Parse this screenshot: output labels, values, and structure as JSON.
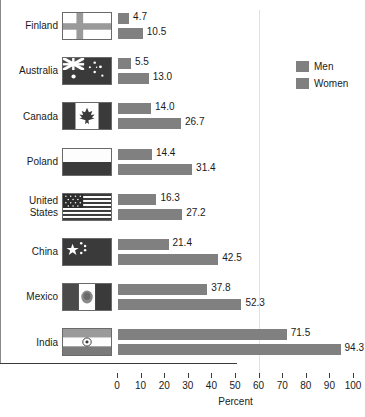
{
  "chart_data": {
    "type": "bar",
    "orientation": "horizontal",
    "title": "",
    "xlabel": "Percent",
    "ylabel": "",
    "xlim": [
      0,
      100
    ],
    "xticks": [
      0,
      10,
      20,
      30,
      40,
      50,
      60,
      70,
      80,
      90,
      100
    ],
    "grid": false,
    "legend_position": "top-right",
    "categories": [
      "Finland",
      "Australia",
      "Canada",
      "Poland",
      "United States",
      "China",
      "Mexico",
      "India"
    ],
    "series": [
      {
        "name": "Men",
        "color": "#808080",
        "values": [
          4.7,
          5.5,
          14.0,
          14.4,
          16.3,
          21.4,
          37.8,
          71.5
        ]
      },
      {
        "name": "Women",
        "color": "#808080",
        "values": [
          10.5,
          13.0,
          26.7,
          31.4,
          27.2,
          42.5,
          52.3,
          94.3
        ]
      }
    ]
  },
  "axis": {
    "tick_labels": [
      "0",
      "10",
      "20",
      "30",
      "40",
      "50",
      "60",
      "70",
      "80",
      "90",
      "100"
    ],
    "title": "Percent"
  },
  "legend": {
    "items": [
      {
        "label": "Men",
        "color": "#808080"
      },
      {
        "label": "Women",
        "color": "#808080"
      }
    ]
  },
  "rows": [
    {
      "country": "Finland",
      "flag": "flag-finland",
      "men_value": "4.7",
      "women_value": "10.5"
    },
    {
      "country": "Australia",
      "flag": "flag-australia",
      "men_value": "5.5",
      "women_value": "13.0"
    },
    {
      "country": "Canada",
      "flag": "flag-canada",
      "men_value": "14.0",
      "women_value": "26.7"
    },
    {
      "country": "Poland",
      "flag": "flag-poland",
      "men_value": "14.4",
      "women_value": "31.4"
    },
    {
      "country": "United\nStates",
      "flag": "flag-united-states",
      "men_value": "16.3",
      "women_value": "27.2"
    },
    {
      "country": "China",
      "flag": "flag-china",
      "men_value": "21.4",
      "women_value": "42.5"
    },
    {
      "country": "Mexico",
      "flag": "flag-mexico",
      "men_value": "37.8",
      "women_value": "52.3"
    },
    {
      "country": "India",
      "flag": "flag-india",
      "men_value": "71.5",
      "women_value": "94.3"
    }
  ]
}
